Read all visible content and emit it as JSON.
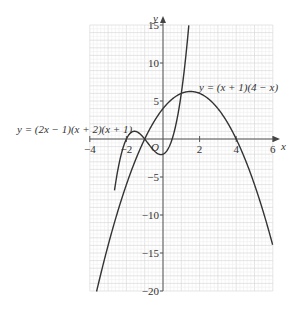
{
  "chart_data": {
    "type": "line",
    "title": "",
    "xlabel": "x",
    "ylabel": "y",
    "origin_label": "O",
    "xlim": [
      -4,
      6
    ],
    "ylim": [
      -20,
      15
    ],
    "xticks": [
      -4,
      -2,
      2,
      4,
      6
    ],
    "xtick_labels": [
      "−4",
      "−2",
      "2",
      "4",
      "6"
    ],
    "yticks": [
      15,
      10,
      5,
      -5,
      -10,
      -15,
      -20
    ],
    "ytick_labels": [
      "15",
      "10",
      "5",
      "−5",
      "−10",
      "−15",
      "−20"
    ],
    "grid": true,
    "series": [
      {
        "name": "y = (2x − 1)(x + 2)(x + 1)",
        "expression": "(2x-1)(x+2)(x+1)",
        "roots": [
          -2,
          -1,
          0.5
        ],
        "y_intercept": -2,
        "x_range": [
          -2.65,
          1.48
        ]
      },
      {
        "name": "y = (x + 1)(4 − x)",
        "expression": "(x+1)(4-x)",
        "roots": [
          -1,
          4
        ],
        "y_intercept": 4,
        "vertex": [
          1.5,
          6.25
        ],
        "x_range": [
          -3.65,
          6
        ]
      }
    ],
    "annotations": [
      {
        "text": "y = (2x − 1)(x + 2)(x + 1)",
        "near": [
          -2.2,
          1
        ]
      },
      {
        "text": "y = (x + 1)(4 − x)",
        "near": [
          4,
          7.5
        ]
      }
    ]
  },
  "labels": {
    "x_axis": "x",
    "y_axis": "y",
    "origin": "O",
    "cubic": "y = (2x − 1)(x + 2)(x + 1)",
    "quadratic": "y = (x + 1)(4 − x)",
    "xt": [
      "−4",
      "−2",
      "2",
      "4",
      "6"
    ],
    "yt": [
      "15",
      "10",
      "5",
      "−5",
      "−10",
      "−15",
      "−20"
    ]
  }
}
